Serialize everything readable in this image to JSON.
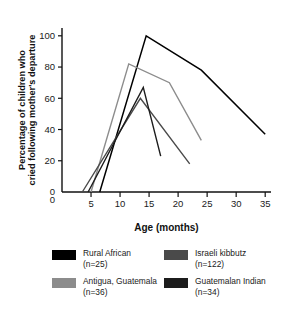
{
  "chart_data": {
    "type": "line",
    "title": "",
    "xlabel": "Age (months)",
    "ylabel": "Percentage of children who cried following mother's departure",
    "xlim": [
      0,
      36
    ],
    "ylim": [
      0,
      105
    ],
    "xticks": [
      5,
      10,
      15,
      20,
      25,
      30,
      35
    ],
    "xtick_labels": [
      "5",
      "10",
      "15",
      "20",
      "25",
      "30",
      "35"
    ],
    "yticks": [
      0,
      20,
      40,
      60,
      80,
      100
    ],
    "ytick_labels": [
      "0",
      "20",
      "40",
      "60",
      "80",
      "100"
    ],
    "origin_label": "0",
    "grid": false,
    "legend_position": "below",
    "series": [
      {
        "name": "Rural African",
        "n_label": "(n=25)",
        "color": "#000000",
        "stroke_width": 1.5,
        "x": [
          6.5,
          14.5,
          24.0,
          35.0
        ],
        "y": [
          0,
          100,
          78,
          37
        ]
      },
      {
        "name": "Antigua, Guatemala",
        "n_label": "(n=36)",
        "color": "#8c8c8c",
        "stroke_width": 1.4,
        "x": [
          5.0,
          11.5,
          18.5,
          24.0
        ],
        "y": [
          0,
          82,
          70,
          33
        ]
      },
      {
        "name": "Israeli kibbutz",
        "n_label": "(n=122)",
        "color": "#4a4a4a",
        "stroke_width": 1.4,
        "x": [
          3.5,
          13.5,
          22.0
        ],
        "y": [
          0,
          60,
          18
        ]
      },
      {
        "name": "Guatemalan Indian",
        "n_label": "(n=34)",
        "color": "#1c1c1c",
        "stroke_width": 1.4,
        "x": [
          4.5,
          14.0,
          17.0
        ],
        "y": [
          0,
          67,
          23
        ]
      }
    ]
  },
  "legend": {
    "items": [
      {
        "label": "Rural African",
        "n": "(n=25)",
        "color": "#000000"
      },
      {
        "label": "Israeli kibbutz",
        "n": "(n=122)",
        "color": "#4a4a4a"
      },
      {
        "label": "Antigua, Guatemala",
        "n": "(n=36)",
        "color": "#8c8c8c"
      },
      {
        "label": "Guatemalan Indian",
        "n": "(n=34)",
        "color": "#1c1c1c"
      }
    ]
  }
}
